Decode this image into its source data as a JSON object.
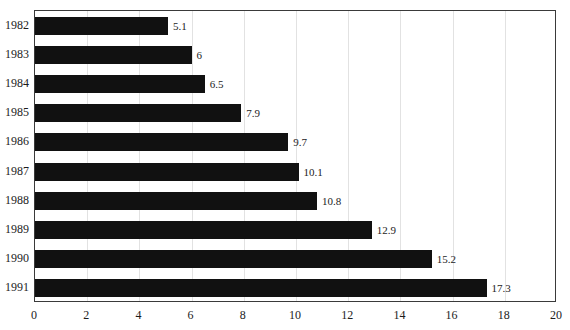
{
  "chart_data": {
    "type": "bar",
    "orientation": "horizontal",
    "title": "",
    "xlabel": "",
    "ylabel": "",
    "categories": [
      "1982",
      "1983",
      "1984",
      "1985",
      "1986",
      "1987",
      "1988",
      "1989",
      "1990",
      "1991"
    ],
    "values": [
      5.1,
      6,
      6.5,
      7.9,
      9.7,
      10.1,
      10.8,
      12.9,
      15.2,
      17.3
    ],
    "value_labels": [
      "5.1",
      "6",
      "6.5",
      "7.9",
      "9.7",
      "10.1",
      "10.8",
      "12.9",
      "15.2",
      "17.3"
    ],
    "xlim": [
      0,
      20
    ],
    "xticks": [
      0,
      2,
      4,
      6,
      8,
      10,
      12,
      14,
      16,
      18,
      20
    ],
    "xtick_labels": [
      "0",
      "2",
      "4",
      "6",
      "8",
      "10",
      "12",
      "14",
      "16",
      "18",
      "20"
    ],
    "grid": true,
    "grid_axis": "x",
    "legend": false,
    "bar_color": "#111111",
    "grid_color": "#e2e2e2",
    "frame_color": "#3a3a3a",
    "background_color": "#ffffff",
    "text_color": "#1c1c1c"
  }
}
